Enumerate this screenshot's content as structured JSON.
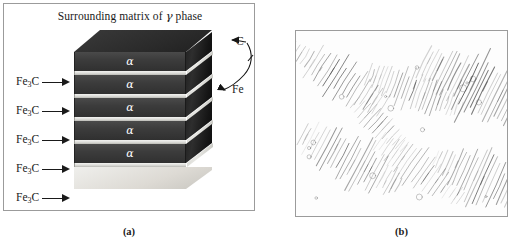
{
  "figure": {
    "panel_a": {
      "title": "Surrounding matrix of γ phase",
      "title_prefix": "Surrounding matrix of ",
      "title_symbol": "γ",
      "title_suffix": " phase",
      "caption": "(a)",
      "lamella_label": "α",
      "lamellae": [
        {
          "label": "α"
        },
        {
          "label": "α"
        },
        {
          "label": "α"
        },
        {
          "label": "α"
        },
        {
          "label": "α"
        }
      ],
      "cementite_labels": [
        {
          "formula": "Fe",
          "subscript": "3",
          "element": "C",
          "text": "Fe3C"
        },
        {
          "formula": "Fe",
          "subscript": "3",
          "element": "C",
          "text": "Fe3C"
        },
        {
          "formula": "Fe",
          "subscript": "3",
          "element": "C",
          "text": "Fe3C"
        },
        {
          "formula": "Fe",
          "subscript": "3",
          "element": "C",
          "text": "Fe3C"
        },
        {
          "formula": "Fe",
          "subscript": "3",
          "element": "C",
          "text": "Fe3C"
        }
      ],
      "annotations": {
        "carbon": "C",
        "iron": "Fe"
      },
      "colors": {
        "ferrite_layer": "#3c3c3c",
        "cementite_plate": "#dcdcd8",
        "panel_border": "#9b9b9b",
        "text": "#1a1a1a"
      }
    },
    "panel_b": {
      "caption": "(b)",
      "micrograph_alt": "lamellar pearlite micrograph",
      "colors": {
        "background": "#ffffff",
        "lamellae": "#4a4a4a",
        "panel_border": "#9b9b9b"
      }
    }
  }
}
